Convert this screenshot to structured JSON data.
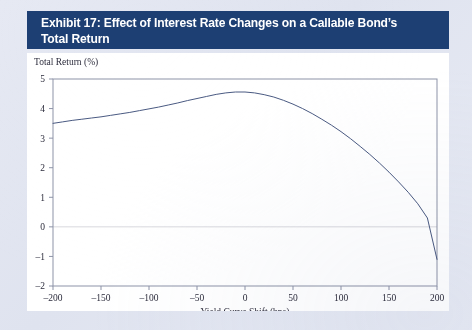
{
  "exhibit": {
    "banner_line1": "Exhibit 17: Effect of Interest Rate Changes on a Callable Bond’s",
    "banner_line2": "Total Return",
    "banner_color": "#1d3f73",
    "card_color": "#ffffff",
    "page_background": "#dfe3ef"
  },
  "chart_data": {
    "type": "line",
    "title": "Exhibit 17: Effect of Interest Rate Changes on a Callable Bond’s Total Return",
    "xlabel": "Yield Curve Shift (bps)",
    "ylabel": "Total Return (%)",
    "xlim": [
      -200,
      200
    ],
    "ylim": [
      -2,
      5
    ],
    "xticks": [
      -200,
      -150,
      -100,
      -50,
      0,
      50,
      100,
      150,
      200
    ],
    "xtick_labels": [
      "–200",
      "–150",
      "–100",
      "–50",
      "0",
      "50",
      "100",
      "150",
      "200"
    ],
    "yticks": [
      -2,
      -1,
      0,
      1,
      2,
      3,
      4,
      5
    ],
    "ytick_labels": [
      "–2",
      "–1",
      "0",
      "1",
      "2",
      "3",
      "4",
      "5"
    ],
    "grid": false,
    "zero_line": true,
    "zero_line_color": "#d8d8dd",
    "legend": null,
    "series": [
      {
        "name": "Callable bond total return",
        "color": "#4a5a82",
        "line_width": 1.0,
        "x": [
          -200,
          -190,
          -180,
          -170,
          -160,
          -150,
          -140,
          -130,
          -120,
          -110,
          -100,
          -90,
          -80,
          -70,
          -60,
          -50,
          -40,
          -30,
          -20,
          -10,
          0,
          10,
          20,
          30,
          40,
          50,
          60,
          70,
          80,
          90,
          100,
          110,
          120,
          130,
          140,
          150,
          160,
          170,
          180,
          190,
          200
        ],
        "y": [
          3.5,
          3.55,
          3.6,
          3.64,
          3.68,
          3.72,
          3.77,
          3.82,
          3.87,
          3.93,
          3.99,
          4.05,
          4.12,
          4.19,
          4.27,
          4.34,
          4.41,
          4.48,
          4.53,
          4.56,
          4.56,
          4.53,
          4.47,
          4.39,
          4.28,
          4.15,
          4.0,
          3.83,
          3.64,
          3.44,
          3.22,
          2.98,
          2.72,
          2.45,
          2.16,
          1.85,
          1.52,
          1.17,
          0.78,
          0.3,
          -1.1
        ]
      }
    ],
    "annotations": {
      "peak_x": -5,
      "peak_y": 4.56,
      "zero_crossing_x": 162
    }
  }
}
